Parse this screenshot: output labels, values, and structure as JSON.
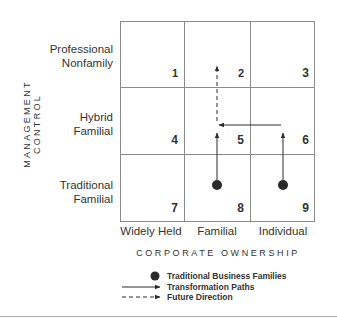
{
  "axes": {
    "y_title": "MANAGEMENT CONTROL",
    "x_title": "CORPORATE OWNERSHIP",
    "rows": [
      {
        "label_line1": "Professional",
        "label_line2": "Nonfamily"
      },
      {
        "label_line1": "Hybrid",
        "label_line2": "Familial"
      },
      {
        "label_line1": "Traditional",
        "label_line2": "Familial"
      }
    ],
    "columns": [
      "Widely Held",
      "Familial",
      "Individual"
    ]
  },
  "cells": [
    "1",
    "2",
    "3",
    "4",
    "5",
    "6",
    "7",
    "8",
    "9"
  ],
  "markers": [
    {
      "type": "Traditional Business Families",
      "cell": "8"
    },
    {
      "type": "Traditional Business Families",
      "cell": "9"
    }
  ],
  "paths": [
    {
      "type": "Transformation Paths",
      "from": "8",
      "to": "5"
    },
    {
      "type": "Transformation Paths",
      "from": "9",
      "to": "6"
    },
    {
      "type": "Transformation Paths",
      "from": "6",
      "to": "5"
    },
    {
      "type": "Future Direction",
      "from": "5",
      "to": "2"
    }
  ],
  "legend": {
    "dot": "Traditional Business Families",
    "solid": "Transformation Paths",
    "dashed": "Future Direction"
  },
  "colors": {
    "grid": "#8a8a8a",
    "ink": "#2b2b2b",
    "rule": "#a9a9a9"
  }
}
